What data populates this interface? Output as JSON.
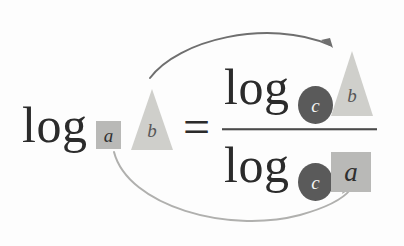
{
  "diagram": {
    "background_color": "#fdfdfd",
    "ink_color": "#2b2b2b",
    "equation_plain": "log_a b = log_c b / log_c a",
    "left_side": {
      "log_word": "log",
      "base_token": {
        "text": "a",
        "shape": "square",
        "fill": "#b9b9b7",
        "text_color": "#2f2f2f"
      },
      "argument_token": {
        "text": "b",
        "shape": "triangle",
        "fill": "#cfcfcb",
        "text_color": "#575757"
      }
    },
    "relation": {
      "symbol": "="
    },
    "right_side": {
      "numerator": {
        "log_word": "log",
        "base_token": {
          "text": "c",
          "shape": "circle",
          "fill": "#5a5a5a",
          "text_color": "#f4f4f4"
        },
        "argument_token": {
          "text": "b",
          "shape": "triangle",
          "fill": "#cfcfcb",
          "text_color": "#575757"
        }
      },
      "denominator": {
        "log_word": "log",
        "base_token": {
          "text": "c",
          "shape": "circle",
          "fill": "#5a5a5a",
          "text_color": "#f4f4f4"
        },
        "argument_token": {
          "text": "a",
          "shape": "square",
          "fill": "#b9b9b7",
          "text_color": "#2f2f2f"
        }
      },
      "fraction_bar": {
        "color": "#4a4a4a"
      }
    },
    "arrows": [
      {
        "name": "argument-mapping-arrow",
        "label": "b maps to b",
        "color": "#6f6f6f",
        "from": "left argument triangle b",
        "to": "numerator argument triangle b"
      },
      {
        "name": "base-mapping-arrow",
        "label": "a maps to a",
        "color": "#b0b0ae",
        "from": "left base square a",
        "to": "denominator argument square a"
      }
    ]
  }
}
